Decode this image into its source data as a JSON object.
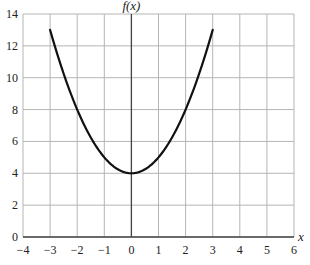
{
  "chart_data": {
    "type": "line",
    "title": "",
    "xlabel": "x",
    "ylabel": "f(x)",
    "xlim": [
      -4,
      6
    ],
    "ylim": [
      0,
      14
    ],
    "grid": true,
    "x_ticks": [
      -4,
      -3,
      -2,
      -1,
      0,
      1,
      2,
      3,
      4,
      5,
      6
    ],
    "x_tick_labels": [
      "−4",
      "−3",
      "−2",
      "−1",
      "0",
      "1",
      "2",
      "3",
      "4",
      "5",
      "6"
    ],
    "y_ticks": [
      0,
      2,
      4,
      6,
      8,
      10,
      12,
      14
    ],
    "y_tick_labels": [
      "0",
      "2",
      "4",
      "6",
      "8",
      "10",
      "12",
      "14"
    ],
    "series": [
      {
        "name": "f(x)",
        "color": "#111111",
        "x": [
          -3,
          -2.5,
          -2,
          -1.5,
          -1,
          -0.5,
          0,
          0.5,
          1,
          1.5,
          2,
          2.5,
          3
        ],
        "values": [
          13,
          10.25,
          8,
          6.25,
          5,
          4.25,
          4,
          4.25,
          5,
          6.25,
          8,
          10.25,
          13
        ]
      }
    ]
  },
  "colors": {
    "grid": "#b5b5b5",
    "axis": "#444444",
    "curve": "#111111"
  }
}
